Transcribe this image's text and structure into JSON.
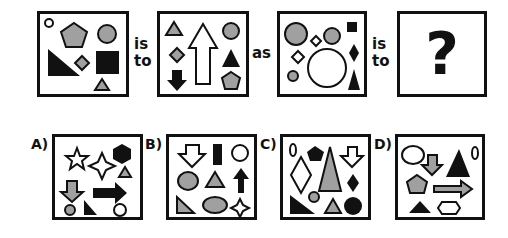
{
  "colors": {
    "black": "#111111",
    "gray": "#a0a0a0",
    "white": "#ffffff",
    "stroke": "#111111"
  },
  "analogy": {
    "connector_is_to_1": {
      "line1": "is",
      "line2": "to"
    },
    "connector_as": "as",
    "connector_is_to_2": {
      "line1": "is",
      "line2": "to"
    },
    "unknown": "?"
  },
  "options": [
    {
      "label": "A)"
    },
    {
      "label": "B)"
    },
    {
      "label": "C)"
    },
    {
      "label": "D)"
    }
  ],
  "panels": {
    "box1": [
      "small white circle",
      "gray pentagon",
      "gray circle",
      "black right triangle",
      "gray diamond",
      "black square",
      "gray triangle"
    ],
    "box2": [
      "gray triangle",
      "white up arrow",
      "gray circle",
      "gray diamond",
      "black triangle",
      "black down arrow",
      "gray pentagon"
    ],
    "box3": [
      "large gray circle",
      "white diamond",
      "gray circle",
      "black square",
      "white diamond",
      "large white circle",
      "black diamond",
      "small gray circle",
      "black triangle"
    ],
    "box4": [
      "question mark"
    ],
    "optionA": [
      "white 5-point star",
      "white 4-point star",
      "black hexagon",
      "gray triangle",
      "gray down arrow",
      "black right arrow",
      "gray circle",
      "black right triangle",
      "white circle"
    ],
    "optionB": [
      "white down arrow",
      "black rectangle",
      "white circle",
      "gray circle",
      "gray triangle",
      "black up arrow",
      "gray right triangle",
      "gray ellipse",
      "white 4-point star"
    ],
    "optionC": [
      "white zero oval",
      "black pentagon",
      "white diamond",
      "large gray triangle",
      "white down arrow",
      "black diamond",
      "gray circle",
      "black right triangle",
      "gray triangle",
      "black circle"
    ],
    "optionD": [
      "white ellipse",
      "gray down arrow",
      "black triangle",
      "white zero oval",
      "gray pentagon",
      "gray right arrow",
      "black triangle",
      "white hexagon"
    ]
  }
}
